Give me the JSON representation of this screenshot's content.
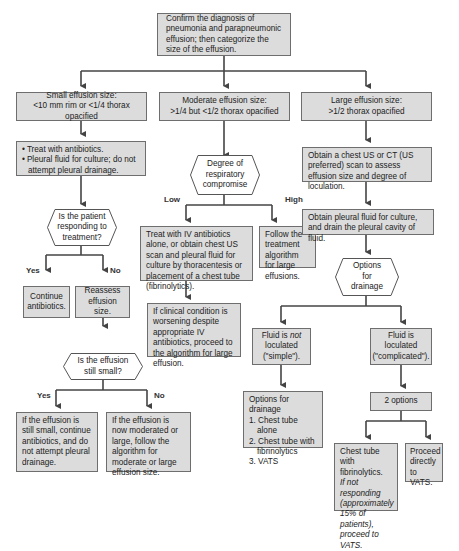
{
  "colors": {
    "box_fill": "#dcdcdc",
    "box_border": "#6e6e6e",
    "line": "#444444",
    "background": "#ffffff"
  },
  "start": {
    "text": "Confirm the diagnosis of pneumonia and parapneumonic effusion; then categorize the size of the effusion."
  },
  "small": {
    "header_line1": "Small effusion size:",
    "header_line2": "<10 mm rim or <1/4 thorax opacified",
    "treat_bullets": [
      "Treat with antibiotics.",
      "Pleural fluid for culture; do not attempt pleural drainage."
    ],
    "decision1": "Is the patient responding to treatment?",
    "yes_label": "Yes",
    "no_label": "No",
    "continue": "Continue antibiotics.",
    "reassess": "Reassess effusion size.",
    "decision2": "Is the effusion still small?",
    "yes2_label": "Yes",
    "no2_label": "No",
    "still_small": "If the effusion is still small, continue antibiotics, and do not attempt pleural drainage.",
    "now_larger": "If the effusion is now moderated or large, follow the algorithm for moderate or large effusion size."
  },
  "moderate": {
    "header_line1": "Moderate effusion size:",
    "header_line2": ">1/4 but <1/2 thorax opacified",
    "decision": "Degree of respiratory compromise",
    "low_label": "Low",
    "high_label": "High",
    "low_action": "Treat with IV antibiotics alone, or obtain chest US scan and pleural fluid for culture by thoracentesis or placement of a chest tube (fibrinolytics).",
    "low_action_or": "or",
    "high_action": "Follow the treatment algorithm for large effusions.",
    "worsening": "If clinical condition is worsening despite appropriate IV antibiotics, proceed to the algorithm for large effusion."
  },
  "large": {
    "header_line1": "Large effusion size:",
    "header_line2": ">1/2 thorax opacified",
    "scan": "Obtain a chest US or CT (US preferred) scan to assess effusion size and degree of loculation.",
    "drain": "Obtain pleural fluid for culture, and drain the pleural cavity of fluid.",
    "options_decision": "Options for drainage",
    "not_loculated_pre": "Fluid is ",
    "not_loculated_em": "not",
    "not_loculated_post": " loculated (\"simple\").",
    "loculated": "Fluid is loculated (\"complicated\").",
    "simple_options_title": "Options for drainage",
    "simple_options": [
      "1. Chest tube alone",
      "2. Chest tube with fibrinolytics",
      "3. VATS"
    ],
    "two_options": "2 options",
    "fibrinolytics_main": "Chest tube with fibrinolytics.",
    "fibrinolytics_note": "If not responding (approximately 15% of patients), proceed to VATS.",
    "vats": "Proceed directly to VATS."
  }
}
